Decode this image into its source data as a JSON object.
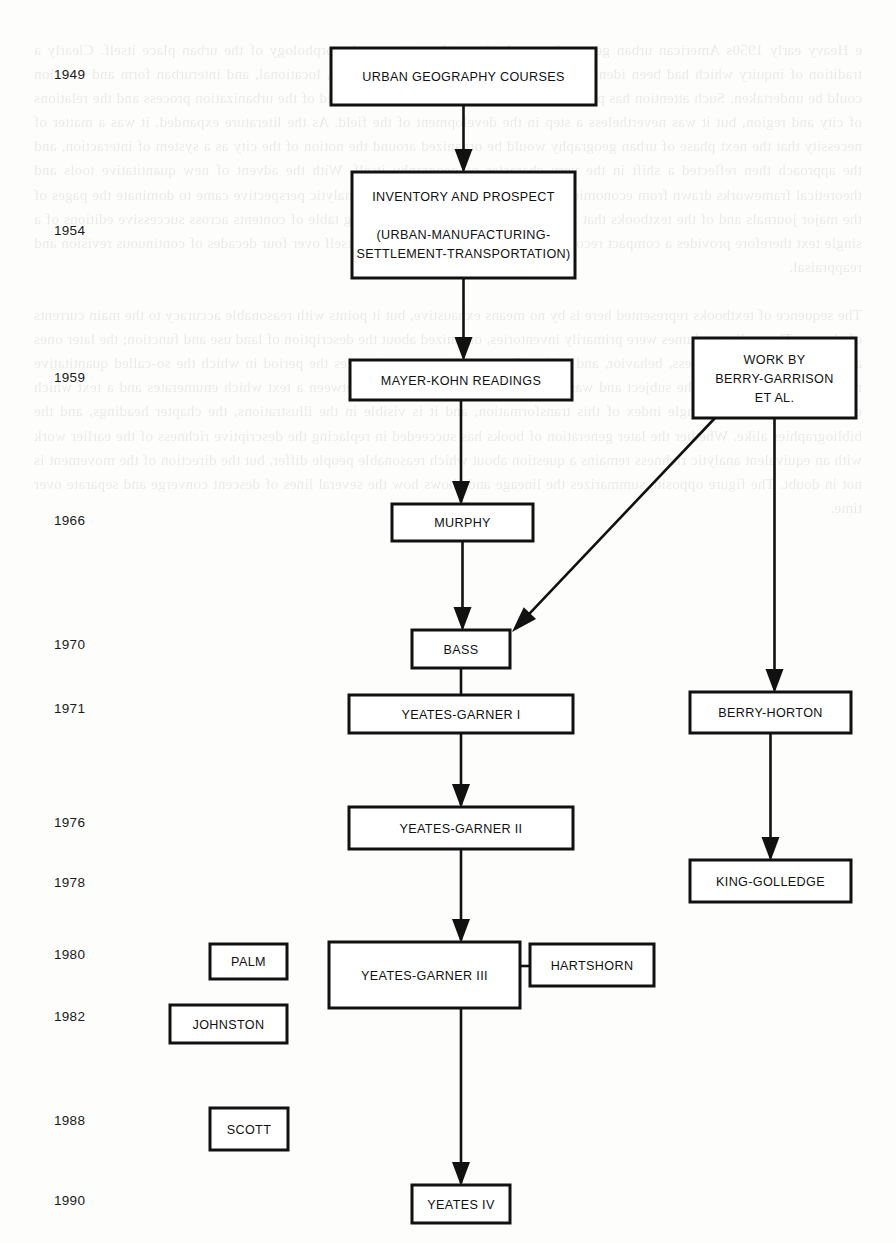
{
  "figure": {
    "type": "flowchart",
    "orientation": "vertical-timeline",
    "background_color": "#fdfdfc",
    "line_color": "#111111",
    "box_fill": "#ffffff"
  },
  "timeline": {
    "axis_label": "",
    "years": [
      {
        "id": "y1949",
        "label": "1949",
        "x": 54,
        "y": 76
      },
      {
        "id": "y1954",
        "label": "1954",
        "x": 54,
        "y": 232
      },
      {
        "id": "y1959",
        "label": "1959",
        "x": 54,
        "y": 379
      },
      {
        "id": "y1966",
        "label": "1966",
        "x": 54,
        "y": 522
      },
      {
        "id": "y1970",
        "label": "1970",
        "x": 54,
        "y": 646
      },
      {
        "id": "y1971",
        "label": "1971",
        "x": 54,
        "y": 710
      },
      {
        "id": "y1976",
        "label": "1976",
        "x": 54,
        "y": 824
      },
      {
        "id": "y1978",
        "label": "1978",
        "x": 54,
        "y": 884
      },
      {
        "id": "y1980",
        "label": "1980",
        "x": 54,
        "y": 956
      },
      {
        "id": "y1982",
        "label": "1982",
        "x": 54,
        "y": 1018
      },
      {
        "id": "y1988",
        "label": "1988",
        "x": 54,
        "y": 1122
      },
      {
        "id": "y1990",
        "label": "1990",
        "x": 54,
        "y": 1202
      }
    ]
  },
  "nodes": [
    {
      "id": "urban-geography-courses",
      "lines": [
        "URBAN GEOGRAPHY COURSES"
      ],
      "x": 331,
      "y": 48,
      "w": 265,
      "h": 57,
      "year": "1949"
    },
    {
      "id": "inventory-and-prospect",
      "lines": [
        "INVENTORY AND PROSPECT",
        "",
        "(URBAN-MANUFACTURING-",
        "SETTLEMENT-TRANSPORTATION)"
      ],
      "x": 352,
      "y": 172,
      "w": 223,
      "h": 106,
      "year": "1954"
    },
    {
      "id": "mayer-kohn-readings",
      "lines": [
        "MAYER-KOHN READINGS"
      ],
      "x": 350,
      "y": 360,
      "w": 222,
      "h": 40,
      "year": "1959"
    },
    {
      "id": "work-by-berry-garrison-et-al",
      "lines": [
        "WORK BY",
        "BERRY-GARRISON",
        "ET AL."
      ],
      "x": 693,
      "y": 338,
      "w": 163,
      "h": 80,
      "year": "1959"
    },
    {
      "id": "murphy",
      "lines": [
        "MURPHY"
      ],
      "x": 392,
      "y": 504,
      "w": 141,
      "h": 37,
      "year": "1966"
    },
    {
      "id": "bass",
      "lines": [
        "BASS"
      ],
      "x": 412,
      "y": 630,
      "w": 98,
      "h": 38,
      "year": "1970"
    },
    {
      "id": "yeates-garner-i",
      "lines": [
        "YEATES-GARNER I"
      ],
      "x": 349,
      "y": 695,
      "w": 224,
      "h": 38,
      "year": "1971"
    },
    {
      "id": "berry-horton",
      "lines": [
        "BERRY-HORTON"
      ],
      "x": 690,
      "y": 692,
      "w": 161,
      "h": 41,
      "year": "1971"
    },
    {
      "id": "yeates-garner-ii",
      "lines": [
        "YEATES-GARNER II"
      ],
      "x": 349,
      "y": 807,
      "w": 224,
      "h": 42,
      "year": "1976"
    },
    {
      "id": "king-golledge",
      "lines": [
        "KING-GOLLEDGE"
      ],
      "x": 690,
      "y": 860,
      "w": 161,
      "h": 42,
      "year": "1978"
    },
    {
      "id": "palm",
      "lines": [
        "PALM"
      ],
      "x": 210,
      "y": 944,
      "w": 77,
      "h": 35,
      "year": "1980"
    },
    {
      "id": "yeates-garner-iii",
      "lines": [
        "YEATES-GARNER III"
      ],
      "x": 329,
      "y": 942,
      "w": 191,
      "h": 66,
      "year": "1980"
    },
    {
      "id": "hartshorn",
      "lines": [
        "HARTSHORN"
      ],
      "x": 530,
      "y": 944,
      "w": 124,
      "h": 42,
      "year": "1980"
    },
    {
      "id": "johnston",
      "lines": [
        "JOHNSTON"
      ],
      "x": 170,
      "y": 1005,
      "w": 117,
      "h": 38,
      "year": "1982"
    },
    {
      "id": "scott",
      "lines": [
        "SCOTT"
      ],
      "x": 210,
      "y": 1108,
      "w": 78,
      "h": 42,
      "year": "1988"
    },
    {
      "id": "yeates-iv",
      "lines": [
        "YEATES IV"
      ],
      "x": 412,
      "y": 1185,
      "w": 98,
      "h": 38,
      "year": "1990"
    }
  ],
  "edges": [
    {
      "id": "e-courses-to-inventory",
      "from": "urban-geography-courses",
      "to": "inventory-and-prospect",
      "kind": "arrow-down"
    },
    {
      "id": "e-inventory-to-mayerkohn",
      "from": "inventory-and-prospect",
      "to": "mayer-kohn-readings",
      "kind": "arrow-down"
    },
    {
      "id": "e-mayerkohn-to-murphy",
      "from": "mayer-kohn-readings",
      "to": "murphy",
      "kind": "arrow-down"
    },
    {
      "id": "e-murphy-to-bass",
      "from": "murphy",
      "to": "bass",
      "kind": "arrow-down"
    },
    {
      "id": "e-berrygarrison-to-bass",
      "from": "work-by-berry-garrison-et-al",
      "to": "bass",
      "kind": "arrow-diagonal"
    },
    {
      "id": "e-berrygarrison-to-berryhorton",
      "from": "work-by-berry-garrison-et-al",
      "to": "berry-horton",
      "kind": "arrow-down"
    },
    {
      "id": "e-bass-to-yg1",
      "from": "bass",
      "to": "yeates-garner-i",
      "kind": "line-down"
    },
    {
      "id": "e-yg1-to-yg2",
      "from": "yeates-garner-i",
      "to": "yeates-garner-ii",
      "kind": "arrow-down"
    },
    {
      "id": "e-berryhorton-to-kinggolledge",
      "from": "berry-horton",
      "to": "king-golledge",
      "kind": "arrow-down"
    },
    {
      "id": "e-yg2-to-yg3",
      "from": "yeates-garner-ii",
      "to": "yeates-garner-iii",
      "kind": "arrow-down"
    },
    {
      "id": "e-hartshorn-to-yg3",
      "from": "hartshorn",
      "to": "yeates-garner-iii",
      "kind": "line-horizontal"
    },
    {
      "id": "e-yg3-to-yeatesiv",
      "from": "yeates-garner-iii",
      "to": "yeates-iv",
      "kind": "arrow-down"
    }
  ],
  "bleed_through_text": "e Heavy early 1950s American urban geography emphasis on the pattern and morphology of the urban place itself. Clearly a tradition of inquiry which had been identified in that the investigation of regional, locational, and interurban form and function could be undertaken. Such attention has passed only in recent years to the wider field of the urbanization process and the relations of city and region, but it was nevertheless a step in the development of the field. As the literature expanded, it was a matter of necessity that the next phase of urban geography would be organized around the notion of the city as a system of interaction, and the approach then reflected a shift in the very character of geography itself. With the advent of new quantitative tools and theoretical frameworks drawn from economics and the social sciences, a more analytic perspective came to dominate the pages of the major journals and of the textbooks that followed them in turn. The changing table of contents across successive editions of a single text therefore provides a compact record of the discipline as it redefined itself over four decades of continuous revision and reappraisal.\n\nThe sequence of textbooks represented here is by no means exhaustive, but it points with reasonable accuracy to the main currents of change. The earliest volumes were primarily inventories, organized about the description of land use and function; the later ones are structured around process, behavior, and policy. Between these two poles lies the period in which the so-called quantitative revolution swept through the subject and was absorbed by it. The distinction between a text which enumerates and a text which explains is the clearest single index of this transformation, and it is visible in the illustrations, the chapter headings, and the bibliographies alike. Whether the later generation of books has succeeded in replacing the descriptive richness of the earlier work with an equivalent analytic richness remains a question about which reasonable people differ, but the direction of the movement is not in doubt. The figure opposite summarizes the lineage and shows how the several lines of descent converge and separate over time."
}
